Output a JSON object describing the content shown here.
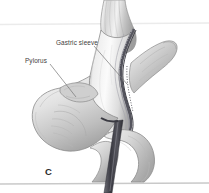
{
  "figure": {
    "panel_letter": "C",
    "background_color": "#ffffff",
    "rules": [
      {
        "name": "top-rule",
        "y": 24,
        "color": "#e9e9e9"
      },
      {
        "name": "bottom-rule",
        "y": 184,
        "color": "#c9c9c9"
      }
    ],
    "annotations": [
      {
        "id": "gastric-sleeve",
        "label": "Gastric sleeve",
        "leader": {
          "x1": 94,
          "y1": 46,
          "x2": 127,
          "y2": 84
        },
        "color": "#3d3d3d"
      },
      {
        "id": "pylorus",
        "label": "Pylorus",
        "leader": {
          "x1": 50,
          "y1": 64,
          "x2": 76,
          "y2": 97
        },
        "color": "#3d3d3d"
      }
    ],
    "anatomy": {
      "esophagus": {
        "name": "esophagus",
        "fill": "#d8d8d8"
      },
      "gastric_sleeve": {
        "name": "gastric-sleeve-tube",
        "fill": "#e4e4e4"
      },
      "staple_line": {
        "name": "staple-line",
        "color": "#4a4a52"
      },
      "resected_stomach": {
        "name": "resected-stomach-specimen",
        "fill": "#d2d2d2"
      },
      "antrum": {
        "name": "gastric-antrum",
        "fill": "#dedede"
      },
      "pylorus": {
        "name": "pylorus-ring",
        "fill": "#cfcfcf"
      },
      "duodenum": {
        "name": "duodenum",
        "fill": "#d9d9d9"
      },
      "bougie": {
        "name": "bougie-tube",
        "fill": "#4b4b52"
      }
    }
  }
}
